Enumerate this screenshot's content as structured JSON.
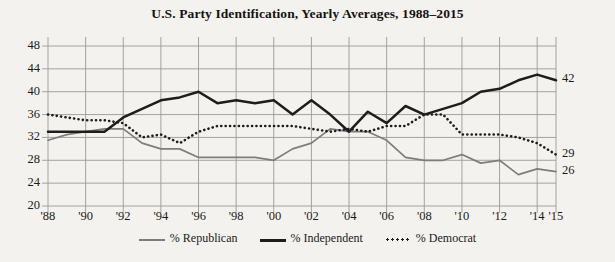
{
  "chart_data": {
    "type": "line",
    "title": "U.S. Party Identification, Yearly Averages, 1988–2015",
    "xlabel": "",
    "ylabel": "",
    "ylim": [
      20,
      48
    ],
    "yticks": [
      20,
      24,
      28,
      32,
      36,
      40,
      44,
      48
    ],
    "grid": true,
    "legend_position": "bottom-center",
    "x": [
      1988,
      1989,
      1990,
      1991,
      1992,
      1993,
      1994,
      1995,
      1996,
      1997,
      1998,
      1999,
      2000,
      2001,
      2002,
      2003,
      2004,
      2005,
      2006,
      2007,
      2008,
      2009,
      2010,
      2011,
      2012,
      2013,
      2014,
      2015
    ],
    "xticks": [
      1988,
      1990,
      1992,
      1994,
      1996,
      1998,
      2000,
      2002,
      2004,
      2006,
      2008,
      2010,
      2012,
      2014,
      2015
    ],
    "xticklabels": [
      "'88",
      "'90",
      "'92",
      "'94",
      "'96",
      "'98",
      "'00",
      "'02",
      "'04",
      "'06",
      "'08",
      "'10",
      "'12",
      "'14",
      "'15"
    ],
    "series": [
      {
        "name": "% Republican",
        "color": "#7d7d7d",
        "style": "solid",
        "end_label": "26",
        "values": [
          31.5,
          32.5,
          33,
          33.5,
          33.5,
          31,
          30,
          30,
          28.5,
          28.5,
          28.5,
          28.5,
          28,
          30,
          31,
          33.5,
          33,
          33,
          31.5,
          28.5,
          28,
          28,
          29,
          27.5,
          28,
          25.5,
          26.5,
          26
        ]
      },
      {
        "name": "% Independent",
        "color": "#1d1d1d",
        "style": "solid",
        "end_label": "42",
        "values": [
          33,
          33,
          33,
          33,
          35.5,
          37,
          38.5,
          39,
          40,
          38,
          38.5,
          38,
          38.5,
          36,
          38.5,
          36,
          33,
          36.5,
          34.5,
          37.5,
          36,
          37,
          38,
          40,
          40.5,
          42,
          43,
          42
        ]
      },
      {
        "name": "% Democrat",
        "color": "#1d1d1d",
        "style": "dotted",
        "end_label": "29",
        "values": [
          36,
          35.5,
          35,
          35,
          34.5,
          32,
          32.5,
          31,
          33,
          34,
          34,
          34,
          34,
          34,
          33.5,
          33,
          33.5,
          33,
          34,
          34,
          36,
          36,
          32.5,
          32.5,
          32.5,
          32,
          31,
          29
        ]
      }
    ]
  },
  "legend": {
    "items": [
      {
        "label": "% Republican",
        "key": "republican"
      },
      {
        "label": "% Independent",
        "key": "independent"
      },
      {
        "label": "% Democrat",
        "key": "democrat"
      }
    ]
  }
}
